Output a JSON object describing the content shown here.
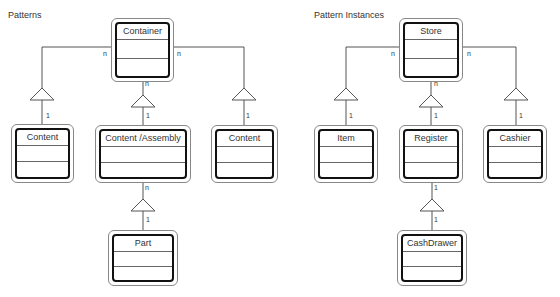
{
  "panels": [
    {
      "title": "Patterns",
      "title_pos": [
        8,
        10
      ],
      "classes": [
        {
          "name": "Container",
          "x": 111,
          "y": 18,
          "w": 63,
          "h": 64
        },
        {
          "name": "Content",
          "x": 11,
          "y": 124,
          "w": 63,
          "h": 59
        },
        {
          "name": "Content /Assembly",
          "x": 95,
          "y": 125,
          "w": 96,
          "h": 58
        },
        {
          "name": "Content",
          "x": 211,
          "y": 125,
          "w": 67,
          "h": 58
        },
        {
          "name": "Part",
          "x": 108,
          "y": 230,
          "w": 70,
          "h": 56
        }
      ]
    },
    {
      "title": "Pattern Instances",
      "title_pos": [
        314,
        10
      ],
      "classes": [
        {
          "name": "Store",
          "x": 399,
          "y": 18,
          "w": 64,
          "h": 64
        },
        {
          "name": "Item",
          "x": 314,
          "y": 125,
          "w": 64,
          "h": 58
        },
        {
          "name": "Register",
          "x": 399,
          "y": 125,
          "w": 64,
          "h": 58
        },
        {
          "name": "Cashier",
          "x": 483,
          "y": 125,
          "w": 64,
          "h": 58
        },
        {
          "name": "CashDrawer",
          "x": 397,
          "y": 230,
          "w": 70,
          "h": 56
        }
      ]
    }
  ],
  "multiplicities": [
    {
      "text": "n",
      "x": 103,
      "y": 50
    },
    {
      "text": "n",
      "x": 177,
      "y": 50
    },
    {
      "text": "n",
      "x": 145,
      "y": 80
    },
    {
      "text": "1",
      "x": 46,
      "y": 112
    },
    {
      "text": "1",
      "x": 146,
      "y": 112
    },
    {
      "text": "1",
      "x": 246,
      "y": 112
    },
    {
      "text": "n",
      "x": 145,
      "y": 184
    },
    {
      "text": "1",
      "x": 146,
      "y": 216
    },
    {
      "text": "n",
      "x": 391,
      "y": 50
    },
    {
      "text": "n",
      "x": 467,
      "y": 50
    },
    {
      "text": "n",
      "x": 434,
      "y": 80
    },
    {
      "text": "1",
      "x": 349,
      "y": 112
    },
    {
      "text": "1",
      "x": 434,
      "y": 112
    },
    {
      "text": "1",
      "x": 519,
      "y": 112
    },
    {
      "text": "1",
      "x": 434,
      "y": 184
    },
    {
      "text": "1",
      "x": 434,
      "y": 216
    }
  ],
  "connectors": [
    {
      "path": "M111 47 H42 V124",
      "tri": [
        42,
        88
      ]
    },
    {
      "path": "M174 47 H244 V125",
      "tri": [
        244,
        88
      ]
    },
    {
      "path": "M143 82 V125",
      "tri": [
        143,
        95
      ]
    },
    {
      "path": "M143 183 V230",
      "tri": [
        143,
        199
      ]
    },
    {
      "path": "M399 47 H346 V125",
      "tri": [
        346,
        88
      ]
    },
    {
      "path": "M463 47 H516 V125",
      "tri": [
        516,
        88
      ]
    },
    {
      "path": "M431 82 V125",
      "tri": [
        431,
        95
      ]
    },
    {
      "path": "M432 183 V230",
      "tri": [
        432,
        199
      ]
    }
  ]
}
